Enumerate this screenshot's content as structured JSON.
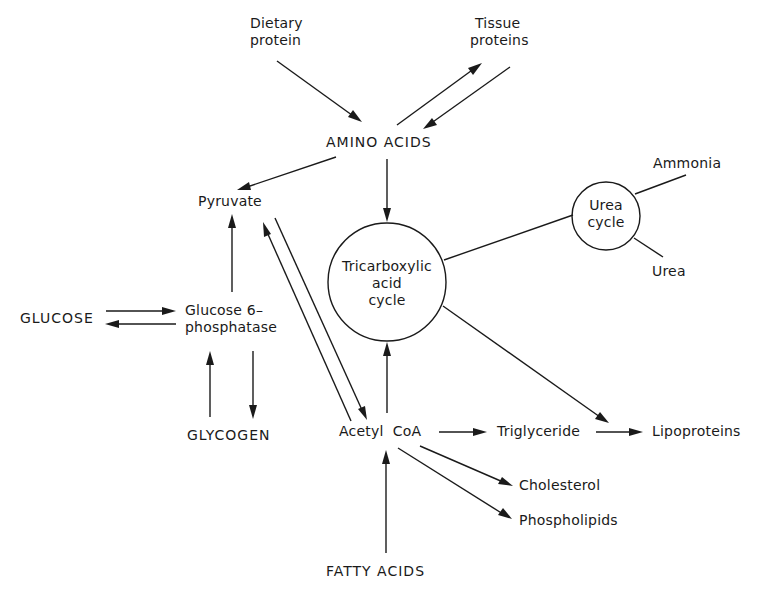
{
  "diagram": {
    "title": "",
    "nodes": {
      "dietary_protein": "Dietary\nprotein",
      "dietary_protein_l1": "Dietary",
      "dietary_protein_l2": "protein",
      "tissue_proteins_l1": "Tissue",
      "tissue_proteins_l2": "proteins",
      "amino_acids": "AMINO ACIDS",
      "pyruvate": "Pyruvate",
      "tca_l1": "Tricarboxylic",
      "tca_l2": "acid",
      "tca_l3": "cycle",
      "urea_cycle_l1": "Urea",
      "urea_cycle_l2": "cycle",
      "ammonia": "Ammonia",
      "urea": "Urea",
      "glucose": "GLUCOSE",
      "g6p_l1": "Glucose 6–",
      "g6p_l2": "phosphatase",
      "glycogen": "GLYCOGEN",
      "acetyl_coa": "Acetyl  CoA",
      "triglyceride": "Triglyceride",
      "lipoproteins": "Lipoproteins",
      "cholesterol": "Cholesterol",
      "phospholipids": "Phospholipids",
      "fatty_acids": "FATTY ACIDS"
    },
    "edges": [
      {
        "from": "Dietary protein",
        "to": "AMINO ACIDS"
      },
      {
        "from": "AMINO ACIDS",
        "to": "Tissue proteins"
      },
      {
        "from": "Tissue proteins",
        "to": "AMINO ACIDS"
      },
      {
        "from": "AMINO ACIDS",
        "to": "Pyruvate"
      },
      {
        "from": "AMINO ACIDS",
        "to": "Tricarboxylic acid cycle"
      },
      {
        "from": "Tricarboxylic acid cycle",
        "to": "Urea cycle",
        "arrow": false
      },
      {
        "from": "Urea cycle",
        "to": "Ammonia",
        "arrow": false
      },
      {
        "from": "Urea cycle",
        "to": "Urea",
        "arrow": false
      },
      {
        "from": "Glucose 6-phosphatase",
        "to": "Pyruvate"
      },
      {
        "from": "GLUCOSE",
        "to": "Glucose 6-phosphatase"
      },
      {
        "from": "Glucose 6-phosphatase",
        "to": "GLUCOSE"
      },
      {
        "from": "GLYCOGEN",
        "to": "Glucose 6-phosphatase"
      },
      {
        "from": "Glucose 6-phosphatase",
        "to": "GLYCOGEN"
      },
      {
        "from": "Acetyl CoA",
        "to": "Pyruvate"
      },
      {
        "from": "Pyruvate",
        "to": "Acetyl CoA"
      },
      {
        "from": "Acetyl CoA",
        "to": "Tricarboxylic acid cycle"
      },
      {
        "from": "Tricarboxylic acid cycle",
        "to": "Lipoproteins"
      },
      {
        "from": "Acetyl CoA",
        "to": "Triglyceride"
      },
      {
        "from": "Triglyceride",
        "to": "Lipoproteins"
      },
      {
        "from": "Acetyl CoA",
        "to": "Cholesterol"
      },
      {
        "from": "Acetyl CoA",
        "to": "Phospholipids"
      },
      {
        "from": "FATTY ACIDS",
        "to": "Acetyl CoA"
      }
    ]
  }
}
